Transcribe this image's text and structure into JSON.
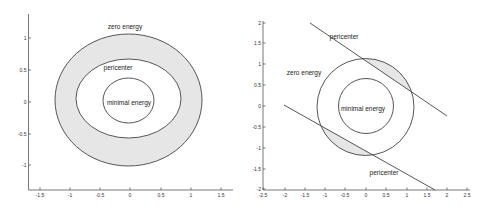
{
  "chart_data": [
    {
      "type": "diagram-plot",
      "title": "",
      "xlabel": "",
      "ylabel": "",
      "xlim": [
        -1.7,
        1.7
      ],
      "ylim": [
        -1.4,
        1.4
      ],
      "xticks": [
        "-1.5",
        "-1",
        "-0.5",
        "0",
        "0.5",
        "1",
        "1.5"
      ],
      "yticks": [
        "1",
        "0.5",
        "0",
        "-0.5",
        "-1"
      ],
      "grid": false,
      "regions": [
        {
          "name": "zero energy",
          "shape": "ellipse",
          "center": [
            0,
            0
          ],
          "rx": 1.2,
          "ry": 1.05,
          "shaded_ring_to": "pericenter"
        },
        {
          "name": "pericenter",
          "shape": "ellipse",
          "center": [
            0.0,
            0.05
          ],
          "rx": 0.85,
          "ry": 0.62
        },
        {
          "name": "minimal energy",
          "shape": "ellipse",
          "center": [
            0,
            0
          ],
          "rx": 0.42,
          "ry": 0.36
        }
      ],
      "annotations": [
        {
          "text": "zero energy",
          "x": -0.05,
          "y": 1.2
        },
        {
          "text": "pericenter",
          "x": -0.12,
          "y": 0.55
        },
        {
          "text": "minimal energy",
          "x": 0.0,
          "y": -0.02
        }
      ]
    },
    {
      "type": "diagram-plot",
      "title": "",
      "xlabel": "",
      "ylabel": "",
      "xlim": [
        -2.5,
        2.5
      ],
      "ylim": [
        -2,
        2
      ],
      "xticks": [
        "-2.5",
        "-2",
        "-1.5",
        "-1",
        "-0.5",
        "0",
        "0.5",
        "1",
        "1.5",
        "2",
        "2.5"
      ],
      "yticks": [
        "2",
        "1.5",
        "1",
        "0.5",
        "0",
        "-0.5",
        "-1",
        "-1.5",
        "-2"
      ],
      "grid": false,
      "regions": [
        {
          "name": "zero energy",
          "shape": "circle",
          "center": [
            0,
            0
          ],
          "r": 1.2
        },
        {
          "name": "minimal energy",
          "shape": "circle",
          "center": [
            0,
            0
          ],
          "r": 0.68
        },
        {
          "name": "pericenter-upper",
          "shape": "line",
          "from": [
            -1.4,
            2.0
          ],
          "to": [
            2.0,
            -0.25
          ]
        },
        {
          "name": "pericenter-lower",
          "shape": "line",
          "from": [
            -2.0,
            0.05
          ],
          "to": [
            1.7,
            -2.0
          ]
        }
      ],
      "shaded": [
        "segment between upper pericenter line and zero-energy circle",
        "segment between lower pericenter line and zero-energy circle"
      ],
      "annotations": [
        {
          "text": "pericenter",
          "x": -0.55,
          "y": 1.7
        },
        {
          "text": "zero energy",
          "x": -1.5,
          "y": 0.8
        },
        {
          "text": "minimal energy",
          "x": 0.0,
          "y": -0.05
        },
        {
          "text": "pericenter",
          "x": 0.45,
          "y": -1.6
        }
      ]
    }
  ],
  "left": {
    "xticks": [
      {
        "label": "-1.5",
        "x": 40
      },
      {
        "label": "-1",
        "x": 70
      },
      {
        "label": "-0.5",
        "x": 100
      },
      {
        "label": "0",
        "x": 130
      },
      {
        "label": "0.5",
        "x": 161
      },
      {
        "label": "1",
        "x": 191
      },
      {
        "label": "1.5",
        "x": 221
      }
    ],
    "yticks": [
      {
        "label": "1",
        "y": 38
      },
      {
        "label": "0.5",
        "y": 70
      },
      {
        "label": "0",
        "y": 102
      },
      {
        "label": "-0.5",
        "y": 134
      },
      {
        "label": "-1",
        "y": 165
      }
    ],
    "labels": {
      "zero_energy": "zero energy",
      "pericenter": "pericenter",
      "minimal_energy": "minimal energy"
    }
  },
  "right": {
    "xticks": [
      {
        "label": "-2.5",
        "x": 263
      },
      {
        "label": "-2",
        "x": 285
      },
      {
        "label": "-1.5",
        "x": 305
      },
      {
        "label": "-1",
        "x": 325
      },
      {
        "label": "-0.5",
        "x": 345
      },
      {
        "label": "0",
        "x": 366
      },
      {
        "label": "0.5",
        "x": 386
      },
      {
        "label": "1",
        "x": 407
      },
      {
        "label": "1.5",
        "x": 427
      },
      {
        "label": "2",
        "x": 447
      },
      {
        "label": "2.5",
        "x": 467
      }
    ],
    "yticks": [
      {
        "label": "2",
        "y": 23
      },
      {
        "label": "1.5",
        "y": 43
      },
      {
        "label": "1",
        "y": 64
      },
      {
        "label": "0.5",
        "y": 85
      },
      {
        "label": "0",
        "y": 106
      },
      {
        "label": "-0.5",
        "y": 127
      },
      {
        "label": "-1",
        "y": 148
      },
      {
        "label": "-1.5",
        "y": 169
      },
      {
        "label": "-2",
        "y": 189
      }
    ],
    "labels": {
      "pericenter_top": "pericenter",
      "zero_energy": "zero energy",
      "minimal_energy": "minimal energy",
      "pericenter_bottom": "pericenter"
    }
  }
}
